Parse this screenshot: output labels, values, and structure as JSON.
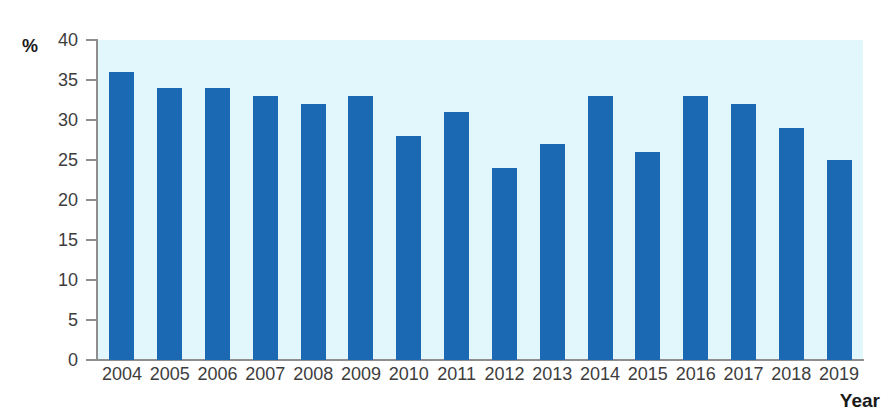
{
  "chart_data": {
    "type": "bar",
    "title": "",
    "subtitle": "",
    "xlabel": "Year",
    "ylabel": "%",
    "categories": [
      "2004",
      "2005",
      "2006",
      "2007",
      "2008",
      "2009",
      "2010",
      "2011",
      "2012",
      "2013",
      "2014",
      "2015",
      "2016",
      "2017",
      "2018",
      "2019"
    ],
    "values": [
      36,
      34,
      34,
      33,
      32,
      33,
      28,
      31,
      24,
      27,
      33,
      26,
      33,
      32,
      29,
      25
    ],
    "ylim": [
      0,
      40
    ],
    "ytick_step": 5,
    "yticks": [
      40,
      35,
      30,
      25,
      20,
      15,
      10,
      5,
      0
    ],
    "ytick_labels": [
      "40",
      "35",
      "30",
      "25",
      "20",
      "15",
      "10",
      "5",
      "0"
    ],
    "grid": false,
    "legend": null,
    "legend_position": "none",
    "annotations": [],
    "series": [
      {
        "name": "",
        "values": [
          36,
          34,
          34,
          33,
          32,
          33,
          28,
          31,
          24,
          27,
          33,
          26,
          33,
          32,
          29,
          25
        ]
      }
    ]
  },
  "axes": {
    "y_unit_label": "%",
    "x_axis_title": "Year"
  },
  "colors": {
    "bar": "#1b68b3",
    "plot_background": "#e1f7fb",
    "page_background": "#ffffff",
    "axis_line": "#8e8e8e",
    "tick_label": "#3d3d3d",
    "axis_title": "#1a1a1a"
  }
}
